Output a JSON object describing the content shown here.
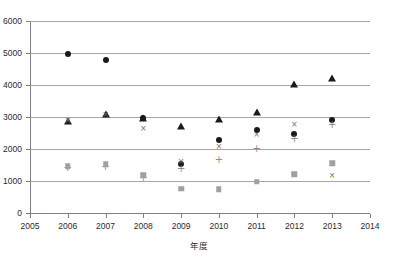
{
  "chart_data": {
    "type": "scatter",
    "title": "",
    "xlabel": "年度",
    "ylabel": "",
    "xlim": [
      2005,
      2014
    ],
    "ylim": [
      0,
      6000
    ],
    "x_tick_labels": [
      "2005",
      "2006",
      "2007",
      "2008",
      "2009",
      "2010",
      "2011",
      "2012",
      "2013",
      "2014"
    ],
    "y_tick_labels": [
      "0",
      "1000",
      "2000",
      "3000",
      "4000",
      "5000",
      "6000"
    ],
    "y_ticks": [
      0,
      1000,
      2000,
      3000,
      4000,
      5000,
      6000
    ],
    "grid": "horizontal",
    "legend": "none",
    "x": [
      2006,
      2007,
      2008,
      2009,
      2010,
      2011,
      2012,
      2013
    ],
    "series": [
      {
        "name": "series-circle",
        "marker": "filled-circle",
        "color": "#1a1a1a",
        "values": [
          4960,
          4780,
          2970,
          1530,
          2280,
          2600,
          2470,
          2900
        ]
      },
      {
        "name": "series-triangle",
        "marker": "filled-triangle",
        "color": "#1a1a1a",
        "values": [
          2870,
          3080,
          2970,
          2730,
          2940,
          3160,
          4030,
          4220
        ]
      },
      {
        "name": "series-cross",
        "marker": "cross-x",
        "color": "#6e6e6e",
        "values": [
          2890,
          3060,
          2620,
          1600,
          2060,
          2430,
          2760,
          1170
        ]
      },
      {
        "name": "series-plus",
        "marker": "plus",
        "color": "#8c8c8c",
        "values": [
          1400,
          1430,
          1090,
          1370,
          1650,
          1990,
          2300,
          2750
        ]
      },
      {
        "name": "series-square",
        "marker": "filled-square",
        "color": "#a0a0a0",
        "values": [
          1460,
          1530,
          1180,
          760,
          740,
          980,
          1210,
          1560
        ]
      }
    ]
  }
}
